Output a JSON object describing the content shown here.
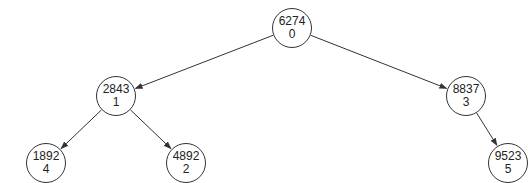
{
  "tree": {
    "nodes": [
      {
        "id": "n0",
        "value": "6274",
        "index": "0",
        "cx": 292,
        "cy": 28
      },
      {
        "id": "n1",
        "value": "2843",
        "index": "1",
        "cx": 116,
        "cy": 96
      },
      {
        "id": "n3",
        "value": "8837",
        "index": "3",
        "cx": 466,
        "cy": 96
      },
      {
        "id": "n4",
        "value": "1892",
        "index": "4",
        "cx": 46,
        "cy": 163
      },
      {
        "id": "n2",
        "value": "4892",
        "index": "2",
        "cx": 186,
        "cy": 163
      },
      {
        "id": "n5",
        "value": "9523",
        "index": "5",
        "cx": 508,
        "cy": 163
      }
    ],
    "edges": [
      {
        "from": "n0",
        "to": "n1"
      },
      {
        "from": "n0",
        "to": "n3"
      },
      {
        "from": "n1",
        "to": "n4"
      },
      {
        "from": "n1",
        "to": "n2"
      },
      {
        "from": "n3",
        "to": "n5"
      }
    ]
  }
}
